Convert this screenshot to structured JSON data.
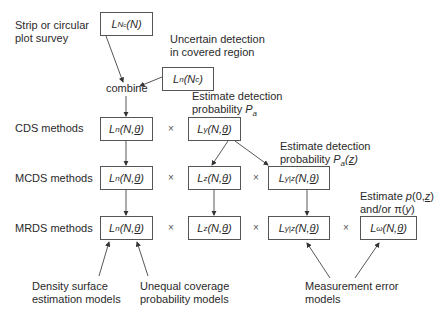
{
  "rows": {
    "top": "Strip or circular\nplot survey",
    "cds": "CDS methods",
    "mcds": "MCDS methods",
    "mrds": "MRDS methods"
  },
  "annotations": {
    "uncertain": [
      "Uncertain detection",
      "in covered region"
    ],
    "combine": "combine",
    "est_pa": [
      "Estimate detection",
      "probability P_a"
    ],
    "est_paz": [
      "Estimate detection",
      "probability P_a(z)"
    ],
    "est_p0": [
      "Estimate p(0,z)",
      "and/or π(y)"
    ],
    "density": [
      "Density surface",
      "estimation models"
    ],
    "unequal": [
      "Unequal coverage",
      "probability models"
    ],
    "measurement": [
      "Measurement error",
      "models"
    ]
  },
  "boxes": {
    "lnc_n": {
      "main": "L",
      "sub": "Nc",
      "arg": "(N)"
    },
    "ln_nc": {
      "main": "L",
      "sub": "n",
      "arg": "(Nc)"
    },
    "cds_ln": {
      "main": "L",
      "sub": "n",
      "arg": "(N,θ)"
    },
    "cds_ly": {
      "main": "L",
      "sub": "y",
      "arg": "(N,θ)"
    },
    "mcds_ln": {
      "main": "L",
      "sub": "n",
      "arg": "(N,θ)"
    },
    "mcds_lz": {
      "main": "L",
      "sub": "z",
      "arg": "(N,θ)"
    },
    "mcds_lyz": {
      "main": "L",
      "sub": "y|z",
      "arg": "(N,θ)"
    },
    "mrds_ln": {
      "main": "L",
      "sub": "n",
      "arg": "(N,θ)"
    },
    "mrds_lz": {
      "main": "L",
      "sub": "z",
      "arg": "(N,θ)"
    },
    "mrds_lyz": {
      "main": "L",
      "sub": "y|z",
      "arg": "(N,θ)"
    },
    "mrds_lw": {
      "main": "L",
      "sub": "ω",
      "arg": "(N,θ)"
    }
  },
  "operators": {
    "times": "×"
  },
  "caption_partial": "Figure"
}
